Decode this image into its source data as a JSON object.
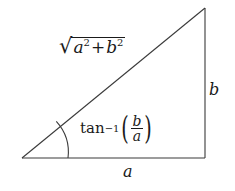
{
  "figure": {
    "background_color": "#ffffff",
    "stroke_color": "#3a3a3a",
    "text_color": "#1a1a1a"
  },
  "geometry": {
    "vertex_left": [
      22,
      158
    ],
    "vertex_right": [
      205,
      158
    ],
    "vertex_top": [
      205,
      8
    ],
    "arc_start": [
      56,
      121
    ],
    "arc_end": [
      73,
      158
    ],
    "arc_radius": 36
  },
  "labels": {
    "hypotenuse": {
      "name": "sqrt-a-squared-plus-b-squared",
      "radical": "√",
      "base_a": "a",
      "exp_a": "2",
      "operator": "+",
      "base_b": "b",
      "exp_b": "2",
      "plain": "sqrt(a^2 + b^2)"
    },
    "angle": {
      "name": "arctangent-b-over-a",
      "function": "tan",
      "inverse_exponent": "−1",
      "paren_open": "(",
      "numerator": "b",
      "denominator": "a",
      "paren_close": ")",
      "plain": "tan^-1(b/a)"
    },
    "vertical_side": {
      "name": "side-b",
      "text": "b"
    },
    "horizontal_side": {
      "name": "side-a",
      "text": "a"
    }
  }
}
